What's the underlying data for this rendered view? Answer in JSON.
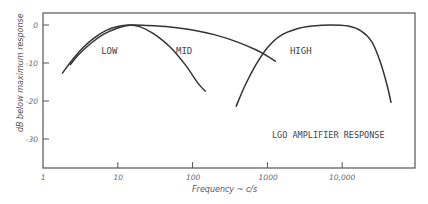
{
  "chart_data": {
    "type": "line",
    "title": "",
    "annotation": "LGO AMPLIFIER RESPONSE",
    "xlabel": "Frequency ~ c/s",
    "ylabel": "dB below maximum response",
    "xscale": "log",
    "xlim": [
      1,
      60000
    ],
    "ylim": [
      -38,
      3
    ],
    "grid": false,
    "x_ticks": [
      {
        "value": 1,
        "label": "1"
      },
      {
        "value": 10,
        "label": "10"
      },
      {
        "value": 100,
        "label": "100"
      },
      {
        "value": 1000,
        "label": "1000"
      },
      {
        "value": 10000,
        "label": "10,000"
      }
    ],
    "y_ticks": [
      {
        "value": 0,
        "label": "0"
      },
      {
        "value": -10,
        "label": "-10"
      },
      {
        "value": -20,
        "label": "-20"
      },
      {
        "value": -30,
        "label": "-30"
      }
    ],
    "series": [
      {
        "name": "LOW",
        "label_pos": {
          "x": 6,
          "y": -3
        },
        "x": [
          1.8,
          2.5,
          3.5,
          5,
          7,
          10,
          14,
          20,
          30,
          50,
          80,
          120,
          150
        ],
        "y": [
          -12.8,
          -9,
          -5.8,
          -3.2,
          -1.4,
          -0.4,
          0,
          -0.5,
          -2.3,
          -5.8,
          -10.5,
          -15.5,
          -17.5
        ]
      },
      {
        "name": "MID",
        "label_pos": {
          "x": 60,
          "y": -3
        },
        "x": [
          2.3,
          3,
          4.5,
          6.5,
          10,
          15,
          25,
          50,
          100,
          200,
          400,
          700,
          1000,
          1300
        ],
        "y": [
          -10.5,
          -7.8,
          -4.6,
          -2.4,
          -0.8,
          0,
          -0.1,
          -0.5,
          -1.3,
          -2.6,
          -4.5,
          -6.5,
          -8.2,
          -9.6
        ]
      },
      {
        "name": "HIGH",
        "label_pos": {
          "x": 2000,
          "y": -3
        },
        "x": [
          380,
          500,
          700,
          1000,
          1500,
          2500,
          4000,
          7000,
          12000,
          18000,
          25000,
          32000,
          40000,
          45000
        ],
        "y": [
          -21.5,
          -16,
          -10.5,
          -6,
          -2.8,
          -1,
          -0.3,
          0,
          -0.3,
          -1.6,
          -4.5,
          -9.5,
          -16,
          -20.5
        ]
      }
    ]
  }
}
